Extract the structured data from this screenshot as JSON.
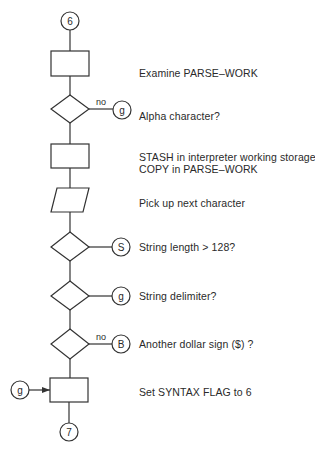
{
  "diagram": {
    "type": "flowchart",
    "entry_connector": "6",
    "exit_connector": "7",
    "steps": [
      {
        "shape": "process",
        "label": "Examine PARSE–WORK"
      },
      {
        "shape": "decision",
        "label": "Alpha character?",
        "branch_label": "no",
        "branch_connector": "g"
      },
      {
        "shape": "process",
        "label_lines": [
          "STASH in interpreter working storage",
          "COPY in PARSE–WORK"
        ]
      },
      {
        "shape": "input-output",
        "label": "Pick up next character"
      },
      {
        "shape": "decision",
        "label": "String length > 128?",
        "branch_label": "",
        "branch_connector": "S"
      },
      {
        "shape": "decision",
        "label": "String delimiter?",
        "branch_label": "",
        "branch_connector": "g"
      },
      {
        "shape": "decision",
        "label": "Another dollar sign ($) ?",
        "branch_label": "no",
        "branch_connector": "B"
      },
      {
        "shape": "process",
        "label": "Set SYNTAX FLAG to 6",
        "incoming_connector": "g"
      }
    ]
  }
}
